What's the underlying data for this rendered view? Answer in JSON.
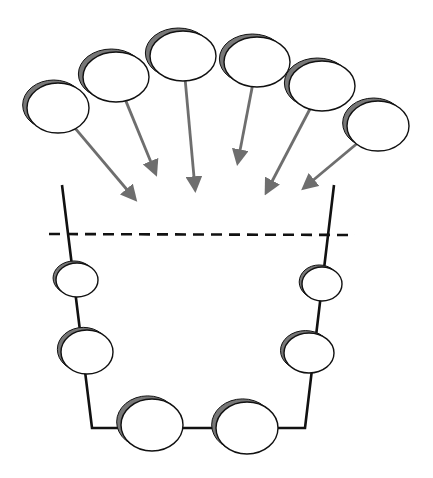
{
  "diagram": {
    "colors": {
      "background": "#ffffff",
      "outline": "#111111",
      "shadow": "#777777",
      "arrow": "#6e6e6e",
      "fill": "#ffffff"
    },
    "incoming_particles": [
      {
        "cx": 58,
        "cy": 108,
        "rx": 31,
        "ry": 25,
        "arrow_to": [
          134,
          198
        ]
      },
      {
        "cx": 116,
        "cy": 77,
        "rx": 33,
        "ry": 25,
        "arrow_to": [
          155,
          172
        ]
      },
      {
        "cx": 183,
        "cy": 56,
        "rx": 33,
        "ry": 25,
        "arrow_to": [
          195,
          188
        ]
      },
      {
        "cx": 257,
        "cy": 62,
        "rx": 33,
        "ry": 25,
        "arrow_to": [
          238,
          161
        ]
      },
      {
        "cx": 322,
        "cy": 86,
        "rx": 33,
        "ry": 25,
        "arrow_to": [
          267,
          191
        ]
      },
      {
        "cx": 378,
        "cy": 126,
        "rx": 31,
        "ry": 25,
        "arrow_to": [
          305,
          187
        ]
      }
    ],
    "container": {
      "path": [
        [
          62,
          185
        ],
        [
          92,
          428
        ],
        [
          305,
          428
        ],
        [
          334,
          185
        ]
      ],
      "dashed_line": {
        "x1": 49,
        "y1": 234,
        "x2": 355,
        "y2": 235
      }
    },
    "bound_particles": [
      {
        "cx": 77,
        "cy": 280,
        "rx": 21,
        "ry": 17
      },
      {
        "cx": 322,
        "cy": 284,
        "rx": 20,
        "ry": 17
      },
      {
        "cx": 87,
        "cy": 352,
        "rx": 26,
        "ry": 22
      },
      {
        "cx": 309,
        "cy": 353,
        "rx": 25,
        "ry": 20
      },
      {
        "cx": 152,
        "cy": 425,
        "rx": 31,
        "ry": 26
      },
      {
        "cx": 247,
        "cy": 428,
        "rx": 31,
        "ry": 26
      }
    ]
  }
}
